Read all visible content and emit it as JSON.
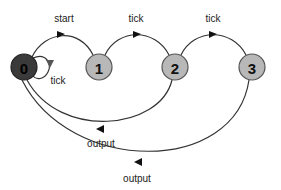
{
  "diagram": {
    "type": "state-machine",
    "nodes": [
      {
        "id": "0",
        "label": "0",
        "cx": 24,
        "cy": 67,
        "fill": "#3a3a3a",
        "text_color": "#000000",
        "role": "initial"
      },
      {
        "id": "1",
        "label": "1",
        "cx": 99,
        "cy": 67,
        "fill": "#b8b8b8",
        "text_color": "#111111"
      },
      {
        "id": "2",
        "label": "2",
        "cx": 175,
        "cy": 67,
        "fill": "#b8b8b8",
        "text_color": "#111111"
      },
      {
        "id": "3",
        "label": "3",
        "cx": 252,
        "cy": 67,
        "fill": "#b8b8b8",
        "text_color": "#111111"
      }
    ],
    "edges": [
      {
        "from": "0",
        "to": "1",
        "label": "start"
      },
      {
        "from": "1",
        "to": "2",
        "label": "tick"
      },
      {
        "from": "2",
        "to": "3",
        "label": "tick"
      },
      {
        "from": "0",
        "to": "0",
        "label": "tick"
      },
      {
        "from": "2",
        "to": "0",
        "label": "output"
      },
      {
        "from": "3",
        "to": "0",
        "label": "output"
      }
    ],
    "labels": {
      "start": "start",
      "tick_1_2": "tick",
      "tick_2_3": "tick",
      "tick_self": "tick",
      "output_2_0": "output",
      "output_3_0": "output"
    }
  }
}
